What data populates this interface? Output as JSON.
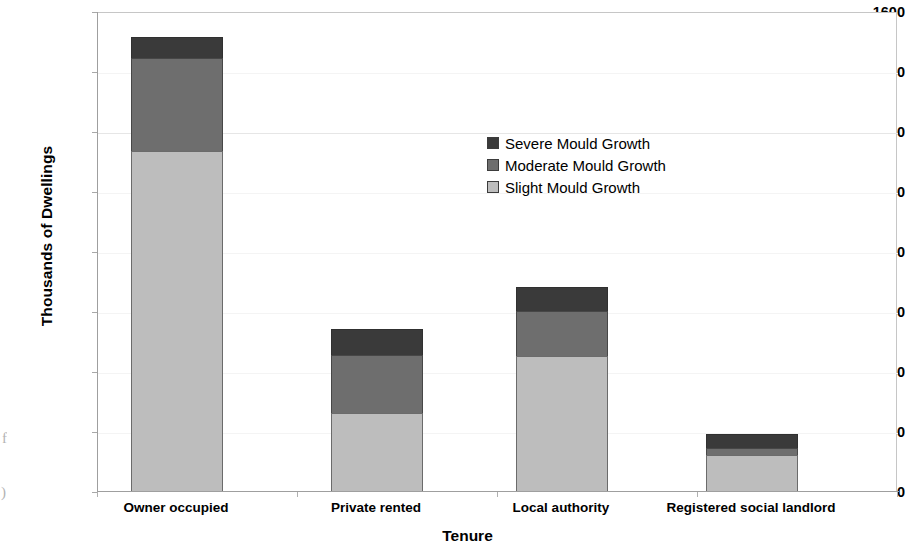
{
  "chart_data": {
    "type": "bar",
    "subtype": "stacked-vertical",
    "title": "",
    "xlabel": "Tenure",
    "ylabel": "Thousands of Dwellings",
    "ylim": [
      0,
      1600
    ],
    "ytick_step": 200,
    "yticks": [
      "1600",
      "1400",
      "1200",
      "1000",
      "800",
      "600",
      "400",
      "200",
      "0"
    ],
    "ytick_values": [
      1600,
      1400,
      1200,
      1000,
      800,
      600,
      400,
      200,
      0
    ],
    "grid": "faint-horizontal",
    "legend_position": "inside-upper-center",
    "categories": [
      "Owner occupied",
      "Private rented",
      "Local authority",
      "Registered social landlord"
    ],
    "series": [
      {
        "name": "Slight Mould Growth",
        "color": "#bdbdbd",
        "values": [
          1135,
          260,
          450,
          120
        ]
      },
      {
        "name": "Moderate Mould Growth",
        "color": "#6e6e6e",
        "values": [
          310,
          195,
          150,
          25
        ]
      },
      {
        "name": "Severe Mould Growth",
        "color": "#3a3a3a",
        "values": [
          70,
          85,
          80,
          45
        ]
      }
    ],
    "stack_order_bottom_to_top": [
      "Slight Mould Growth",
      "Moderate Mould Growth",
      "Severe Mould Growth"
    ],
    "cumulative_totals": [
      1515,
      540,
      680,
      190
    ]
  },
  "legend": {
    "items": [
      {
        "label": "Severe Mould Growth",
        "color": "#3a3a3a"
      },
      {
        "label": "Moderate Mould Growth",
        "color": "#6e6e6e"
      },
      {
        "label": "Slight Mould Growth",
        "color": "#bdbdbd"
      }
    ]
  },
  "artifacts": {
    "left_edge_glyph_1": "f",
    "left_edge_glyph_2": ")"
  }
}
